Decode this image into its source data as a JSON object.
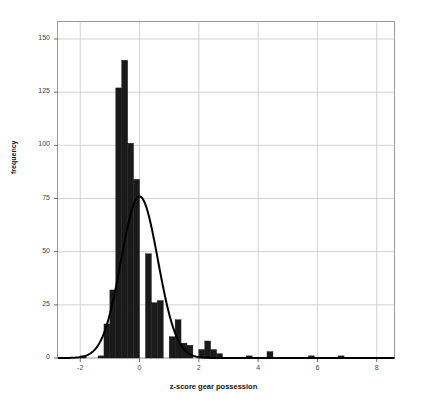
{
  "chart_data": {
    "type": "bar",
    "title": "",
    "subtitle": "",
    "xlabel": "z-score gear possession",
    "ylabel": "frequency",
    "xlim": [
      -2.75,
      8.6
    ],
    "ylim": [
      0,
      158
    ],
    "xticks": [
      -2,
      0,
      2,
      4,
      6,
      8
    ],
    "yticks": [
      0,
      25,
      50,
      75,
      100,
      125,
      150
    ],
    "grid": true,
    "legend": null,
    "bar_color": "#1a1a1a",
    "curve_color": "#000000",
    "grid_color": "#c8c8c8",
    "bin_width": 0.2,
    "bin_centers": [
      -1.85,
      -1.65,
      -1.45,
      -1.25,
      -1.05,
      -0.85,
      -0.65,
      -0.45,
      -0.25,
      -0.05,
      0.15,
      0.35,
      0.55,
      0.75,
      0.95,
      1.15,
      1.35,
      1.55,
      1.75,
      1.95,
      2.15,
      2.35,
      2.55,
      2.75,
      2.95,
      3.15,
      3.95,
      4.55,
      4.75,
      5.95,
      6.15,
      6.95
    ],
    "values": [
      1,
      0,
      1,
      16,
      32,
      127,
      140,
      101,
      84,
      49,
      26,
      27,
      10,
      18,
      7,
      6,
      5,
      8,
      4,
      2,
      1,
      1,
      1,
      3,
      1,
      1,
      1,
      1
    ],
    "bars": [
      {
        "center": -1.9,
        "value": 1
      },
      {
        "center": -1.3,
        "value": 1
      },
      {
        "center": -1.1,
        "value": 16
      },
      {
        "center": -0.9,
        "value": 32
      },
      {
        "center": -0.7,
        "value": 127
      },
      {
        "center": -0.5,
        "value": 140
      },
      {
        "center": -0.3,
        "value": 101
      },
      {
        "center": -0.1,
        "value": 84
      },
      {
        "center": 0.3,
        "value": 49
      },
      {
        "center": 0.5,
        "value": 26
      },
      {
        "center": 0.7,
        "value": 27
      },
      {
        "center": 1.1,
        "value": 10
      },
      {
        "center": 1.3,
        "value": 18
      },
      {
        "center": 1.5,
        "value": 7
      },
      {
        "center": 1.7,
        "value": 6
      },
      {
        "center": 2.1,
        "value": 4
      },
      {
        "center": 2.3,
        "value": 8
      },
      {
        "center": 2.5,
        "value": 4
      },
      {
        "center": 2.7,
        "value": 2
      },
      {
        "center": 3.7,
        "value": 1
      },
      {
        "center": 4.4,
        "value": 3
      },
      {
        "center": 5.8,
        "value": 1
      },
      {
        "center": 6.8,
        "value": 1
      }
    ],
    "normal_curve": {
      "description": "normal distribution overlay",
      "mean": 0.0,
      "std": 0.62,
      "peak_value": 76,
      "peak_x": -0.05
    }
  },
  "axes": {
    "y_tick_labels": [
      "0",
      "25",
      "50",
      "75",
      "100",
      "125",
      "150"
    ],
    "x_tick_labels": [
      "-2",
      "0",
      "2",
      "4",
      "6",
      "8"
    ],
    "ylabel": "frequency",
    "xlabel": "z-score gear possession"
  }
}
